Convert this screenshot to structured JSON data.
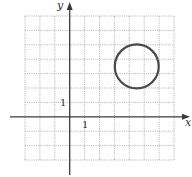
{
  "figure": {
    "x_axis_label": "x",
    "y_axis_label": "y",
    "x_tick_label": "1",
    "y_tick_label": "1"
  },
  "chart_data": {
    "type": "diagram",
    "title": "",
    "xlabel": "x",
    "ylabel": "y",
    "grid": true,
    "grid_style": "dotted",
    "xlim": [
      -3,
      7
    ],
    "ylim": [
      -3,
      7
    ],
    "tick_labels": {
      "x": [
        "1"
      ],
      "y": [
        "1"
      ]
    },
    "shapes": [
      {
        "kind": "circle",
        "center": [
          4.5,
          3.5
        ],
        "radius": 1.5
      }
    ]
  },
  "colors": {
    "grid": "#9a9a9a",
    "axis": "#3a3a3a",
    "circle": "#4a4a4a",
    "background": "#ffffff"
  }
}
